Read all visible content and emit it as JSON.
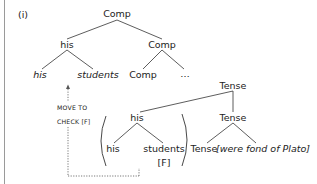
{
  "example_label": "(i)",
  "tree": {
    "root": "Comp",
    "level1": {
      "left": "his",
      "right": "Comp"
    },
    "level2": {
      "his_daughter": "his",
      "students": "students",
      "comp_head": "Comp",
      "ellipsis": "…"
    },
    "tense_phrase": "Tense",
    "level3": {
      "left": "his",
      "right": "Tense"
    },
    "level4": {
      "his": "his",
      "students": "students",
      "tense_head": "Tense",
      "vp": "[were fond of Plato]"
    },
    "feature": "[F]"
  },
  "annotation": {
    "line1": "MOVE TO",
    "line2": "CHECK [F]"
  },
  "colors": {
    "lines": "#333333",
    "border": "#9a9a9a",
    "dotted": "#555555"
  }
}
